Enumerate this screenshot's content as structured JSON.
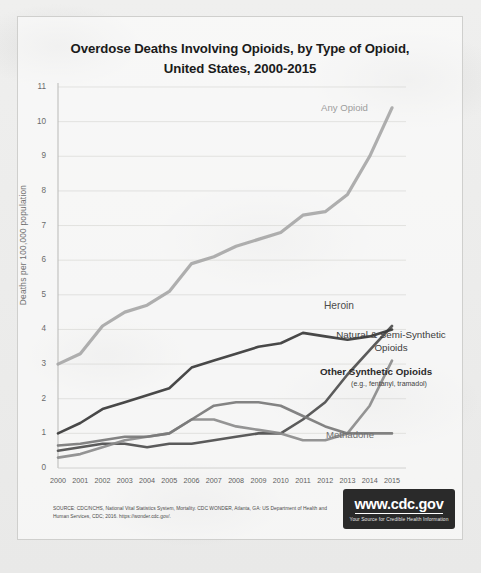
{
  "figure": {
    "title_line1": "Overdose Deaths Involving Opioids, by Type of Opioid,",
    "title_line2": "United States, 2000-2015",
    "source": "SOURCE: CDC/NCHS, National Vital Statistics System, Mortality. CDC WONDER, Atlanta, GA: US Department of Health and Human Services, CDC; 2016. https://wonder.cdc.gov/.",
    "logo": {
      "url_text": "www.cdc.gov",
      "tagline": "Your Source for Credible Health Information"
    }
  },
  "chart_data": {
    "type": "line",
    "title": "Overdose Deaths Involving Opioids, by Type of Opioid, United States, 2000-2015",
    "xlabel": "",
    "ylabel": "Deaths per 100,000 population",
    "categories": [
      "2000",
      "2001",
      "2002",
      "2003",
      "2004",
      "2005",
      "2006",
      "2007",
      "2008",
      "2009",
      "2010",
      "2011",
      "2012",
      "2013",
      "2014",
      "2015"
    ],
    "x": [
      2000,
      2001,
      2002,
      2003,
      2004,
      2005,
      2006,
      2007,
      2008,
      2009,
      2010,
      2011,
      2012,
      2013,
      2014,
      2015
    ],
    "xlim": [
      2000,
      2015
    ],
    "ylim": [
      0,
      11
    ],
    "yticks": [
      0,
      1,
      2,
      3,
      4,
      5,
      6,
      7,
      8,
      9,
      10,
      11
    ],
    "grid": "horizontal-faint",
    "legend": "inline-right-of-series",
    "series": [
      {
        "name": "Any Opioid",
        "color": "#a8a8a8",
        "label_position": "top-right",
        "values": [
          3.0,
          3.3,
          4.1,
          4.5,
          4.7,
          5.1,
          5.9,
          6.1,
          6.4,
          6.6,
          6.8,
          7.3,
          7.4,
          7.9,
          9.0,
          10.4
        ]
      },
      {
        "name": "Heroin",
        "color": "#4f4f4f",
        "label_position": "right",
        "values": [
          0.5,
          0.6,
          0.7,
          0.7,
          0.6,
          0.7,
          0.7,
          0.8,
          0.9,
          1.0,
          1.0,
          1.4,
          1.9,
          2.7,
          3.4,
          4.1
        ]
      },
      {
        "name": "Natural & Semi-Synthetic Opioids",
        "color": "#3a3a3a",
        "label_position": "right",
        "values": [
          1.0,
          1.3,
          1.7,
          1.9,
          2.1,
          2.3,
          2.9,
          3.1,
          3.3,
          3.5,
          3.6,
          3.9,
          3.8,
          3.7,
          3.8,
          4.0
        ]
      },
      {
        "name": "Other Synthetic Opioids",
        "sublabel": "(e.g., fentanyl, tramadol)",
        "color": "#8c8c8c",
        "label_position": "right",
        "values": [
          0.3,
          0.4,
          0.6,
          0.8,
          0.9,
          1.0,
          1.4,
          1.4,
          1.2,
          1.1,
          1.0,
          0.8,
          0.8,
          1.0,
          1.8,
          3.1
        ]
      },
      {
        "name": "Methadone",
        "color": "#7a7a7a",
        "label_position": "right",
        "values": [
          0.65,
          0.7,
          0.8,
          0.9,
          0.9,
          1.0,
          1.4,
          1.8,
          1.9,
          1.9,
          1.8,
          1.5,
          1.2,
          1.0,
          1.0,
          1.0
        ]
      }
    ]
  }
}
